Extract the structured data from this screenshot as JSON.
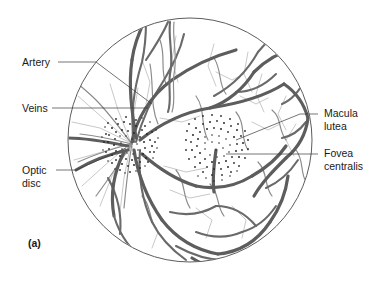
{
  "figure": {
    "caption": "(a)",
    "view_title": "Ophthalmoscopic view of the retina (fundus)",
    "circle": {
      "cx": 190,
      "cy": 140,
      "r": 122
    }
  },
  "labels": {
    "left": [
      {
        "id": "artery",
        "name": "artery-label",
        "lines": [
          "Artery"
        ],
        "x": 22,
        "y": 66
      },
      {
        "id": "veins",
        "name": "veins-label",
        "lines": [
          "Veins"
        ],
        "x": 22,
        "y": 111
      },
      {
        "id": "optic_disc",
        "name": "optic-disc-label",
        "lines": [
          "Optic",
          "disc"
        ],
        "x": 22,
        "y": 176
      }
    ],
    "right": [
      {
        "id": "macula_lutea",
        "name": "macula-lutea-label",
        "lines": [
          "Macula",
          "lutea"
        ],
        "x": 322,
        "y": 117
      },
      {
        "id": "fovea_centralis",
        "name": "fovea-centralis-label",
        "lines": [
          "Fovea",
          "centralis"
        ],
        "x": 322,
        "y": 157
      }
    ]
  },
  "structures": {
    "optic_disc": {
      "cx": 128,
      "cy": 145,
      "rx": 22,
      "ry": 20
    },
    "macula": {
      "cx": 218,
      "cy": 145,
      "rx": 24,
      "ry": 22
    },
    "fovea": {
      "cx": 218,
      "cy": 148
    }
  },
  "colors": {
    "vessel_dark": "#5d5d5d",
    "vessel_mid": "#6a6a6a",
    "vessel_light": "#8c8c8c",
    "vessel_faint": "#b0b0b0",
    "rim": "#4a4a4a",
    "text": "#1a1a1a",
    "leader": "#3a3a3a",
    "background": "#ffffff"
  }
}
